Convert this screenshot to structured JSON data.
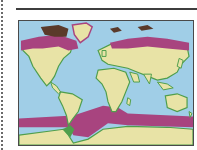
{
  "figure": {
    "type": "world-map",
    "projection": "equirectangular-like",
    "legend": null,
    "caption": null
  },
  "colors": {
    "ocean": "#a9d4ea",
    "ocean_shade": "#8ec4e3",
    "land": "#e8e3a6",
    "coast": "#4f9e4c",
    "highlight_band": "#a8447f",
    "highlight_dark": "#5a3a2a",
    "frame": "#4a4a4a",
    "rule": "#3e3e3e"
  },
  "regions": {
    "highlighted": [
      "arctic-north-america",
      "arctic-eurasia",
      "southern-ocean-band"
    ]
  }
}
